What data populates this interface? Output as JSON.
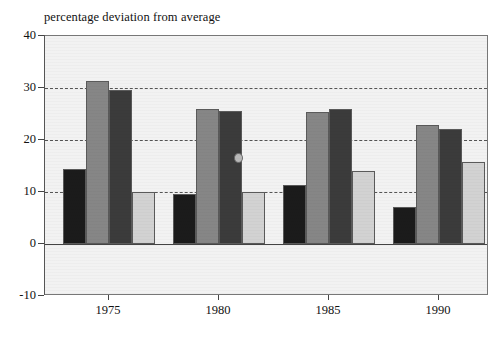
{
  "chart_data": {
    "type": "bar",
    "title": "percentage deviation from average",
    "xlabel": "",
    "ylabel": "",
    "ylim": [
      -10,
      40
    ],
    "ytick_labels": [
      "40",
      "30",
      "20",
      "10",
      "0",
      "-10"
    ],
    "ytick_values": [
      40,
      30,
      20,
      10,
      0,
      -10
    ],
    "grid": true,
    "gridlines_at": [
      30,
      20,
      10
    ],
    "legend": "none",
    "categories": [
      "1975",
      "1980",
      "1985",
      "1990"
    ],
    "series": [
      {
        "name": "series-1",
        "color": "#1b1b1b",
        "values": [
          14.4,
          9.7,
          11.3,
          7.2
        ]
      },
      {
        "name": "series-2",
        "color": "#868686",
        "values": [
          31.3,
          26.0,
          25.4,
          22.9
        ]
      },
      {
        "name": "series-3",
        "color": "#3b3b3b",
        "values": [
          29.6,
          25.6,
          26.0,
          22.1
        ]
      },
      {
        "name": "series-4",
        "color": "#d2d2d2",
        "values": [
          10.0,
          10.0,
          14.0,
          15.7
        ]
      }
    ],
    "annotations": [
      "scan-blemish-on-1980-series-3-bar"
    ],
    "plot_background": "#f2f2f2",
    "frame_color": "#777777"
  }
}
